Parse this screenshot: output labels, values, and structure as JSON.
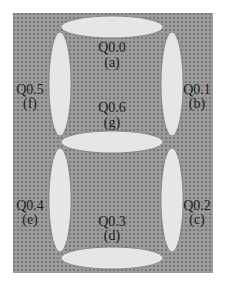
{
  "diagram": {
    "type": "seven-segment-display",
    "colors": {
      "background": "#ffffff",
      "panel": "#9a9a9a",
      "panel_dots": "#6f6f6f",
      "segment_fill": "#e6e6e6",
      "segment_stroke": "#7a7a7a",
      "text": "#1e1e1e"
    },
    "segments": [
      {
        "id": "a",
        "address": "Q0.0",
        "letter": "(a)"
      },
      {
        "id": "b",
        "address": "Q0.1",
        "letter": "(b)"
      },
      {
        "id": "c",
        "address": "Q0.2",
        "letter": "(c)"
      },
      {
        "id": "d",
        "address": "Q0.3",
        "letter": "(d)"
      },
      {
        "id": "e",
        "address": "Q0.4",
        "letter": "(e)"
      },
      {
        "id": "f",
        "address": "Q0.5",
        "letter": "(f)"
      },
      {
        "id": "g",
        "address": "Q0.6",
        "letter": "(g)"
      }
    ]
  }
}
